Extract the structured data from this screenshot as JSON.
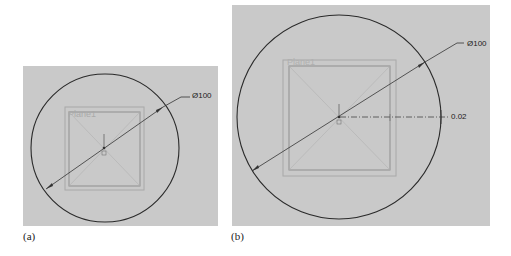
{
  "figure": {
    "panels": [
      {
        "id": "a",
        "caption": "(a)",
        "plane_label": "Plane1",
        "diameter_dimension": "Ø100",
        "colors": {
          "background": "#c9c9c9",
          "circle": "#2a2a2a",
          "plane": "#9a9a9a"
        }
      },
      {
        "id": "b",
        "caption": "(b)",
        "plane_label": "Plane1",
        "diameter_dimension": "Ø100",
        "offset_dimension": "0.02",
        "colors": {
          "background": "#c9c9c9",
          "circle": "#2a2a2a",
          "plane": "#9a9a9a"
        }
      }
    ]
  }
}
